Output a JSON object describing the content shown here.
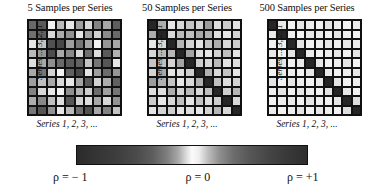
{
  "figure": {
    "caption_symbols": {
      "rho": "ρ"
    }
  },
  "panels": [
    {
      "id": "panel-5-samples",
      "title": "5 Samples per Series",
      "ylabel": "Series ... 3, 2, 1",
      "xlabel": "Series 1, 2, 3, ..."
    },
    {
      "id": "panel-50-samples",
      "title": "50 Samples per Series",
      "ylabel": "Series ... 3, 2, 1",
      "xlabel": "Series 1, 2, 3, ..."
    },
    {
      "id": "panel-500-samples",
      "title": "500 Samples per Series",
      "ylabel": "Series ... 3, 2, 1",
      "xlabel": "Series 1, 2, 3, ..."
    }
  ],
  "colorbar": {
    "label_min": "ρ = − 1",
    "label_mid": "ρ = 0",
    "label_max": "ρ = +1",
    "min_value": -1,
    "mid_value": 0,
    "max_value": 1,
    "colors": {
      "min": "#2b2b2b",
      "mid": "#fbfbfb",
      "max": "#2e2e2e"
    }
  },
  "chart_data": {
    "type": "heatmap",
    "n_panels": 3,
    "grid": {
      "rows": 10,
      "cols": 10
    },
    "xlabel": "Series 1, 2, 3, ...",
    "ylabel": "Series ... 3, 2, 1",
    "zlabel": "ρ",
    "zlim": [
      -1,
      1
    ],
    "colormap": "symmetric grayscale: dark at ρ=−1, white at ρ=0, dark at ρ=+1",
    "legend_position": "bottom horizontal colorbar",
    "grid_on": true,
    "panels": [
      {
        "title": "5 Samples per Series",
        "samples_per_series": 5,
        "note": "Noisy estimates: correlations scatter widely across the full −1..+1 range; diagonal not distinguishable.",
        "values": [
          [
            0.62,
            0.7,
            0.02,
            0.22,
            0.05,
            0.35,
            0.1,
            0.48,
            0.3,
            0.68
          ],
          [
            0.58,
            0.66,
            -0.1,
            0.28,
            0.4,
            0.05,
            0.32,
            0.12,
            0.44,
            0.62
          ],
          [
            0.05,
            0.18,
            0.75,
            0.8,
            0.35,
            0.55,
            0.3,
            0.02,
            0.38,
            0.3
          ],
          [
            0.22,
            0.38,
            0.78,
            0.3,
            0.45,
            0.1,
            0.58,
            0.08,
            0.7,
            0.26
          ],
          [
            0.08,
            0.3,
            0.42,
            0.62,
            0.7,
            0.65,
            0.18,
            0.55,
            0.72,
            0.05
          ],
          [
            0.3,
            0.55,
            0.12,
            0.02,
            0.66,
            0.8,
            0.06,
            0.35,
            0.6,
            0.38
          ],
          [
            0.35,
            0.2,
            0.3,
            0.1,
            0.05,
            0.32,
            0.7,
            0.12,
            0.28,
            0.66
          ],
          [
            0.48,
            0.1,
            0.05,
            0.02,
            0.42,
            0.25,
            0.14,
            0.6,
            0.34,
            0.55
          ],
          [
            0.28,
            0.45,
            0.2,
            0.08,
            0.72,
            0.12,
            0.08,
            0.3,
            0.1,
            0.4
          ],
          [
            0.55,
            0.72,
            0.4,
            0.05,
            0.22,
            0.58,
            0.75,
            0.3,
            0.48,
            0.18
          ]
        ]
      },
      {
        "title": "50 Samples per Series",
        "samples_per_series": 50,
        "note": "Diagonal (ρ=+1) clearly visible as dark cells; off-diagonal estimates cluster near ρ=0 (light) with moderate noise.",
        "values": [
          [
            1.0,
            0.28,
            0.05,
            0.1,
            0.18,
            0.12,
            0.36,
            0.08,
            0.15,
            0.06
          ],
          [
            0.28,
            1.0,
            0.1,
            0.22,
            0.2,
            0.3,
            0.26,
            0.08,
            0.05,
            0.12
          ],
          [
            0.05,
            0.1,
            1.0,
            0.24,
            0.12,
            0.06,
            0.18,
            0.28,
            0.1,
            0.14
          ],
          [
            0.1,
            0.22,
            0.24,
            1.0,
            0.32,
            0.08,
            0.05,
            0.12,
            0.2,
            0.06
          ],
          [
            0.18,
            0.2,
            0.12,
            0.32,
            1.0,
            0.14,
            0.1,
            0.22,
            0.06,
            0.08
          ],
          [
            0.12,
            0.3,
            0.06,
            0.08,
            0.14,
            1.0,
            0.26,
            0.1,
            0.18,
            0.05
          ],
          [
            0.36,
            0.26,
            0.18,
            0.05,
            0.1,
            0.26,
            1.0,
            0.2,
            0.08,
            0.12
          ],
          [
            0.08,
            0.08,
            0.28,
            0.12,
            0.22,
            0.1,
            0.2,
            1.0,
            0.14,
            0.24
          ],
          [
            0.15,
            0.05,
            0.1,
            0.2,
            0.06,
            0.18,
            0.08,
            0.14,
            1.0,
            0.1
          ],
          [
            0.06,
            0.12,
            0.14,
            0.06,
            0.08,
            0.05,
            0.12,
            0.24,
            0.1,
            1.0
          ]
        ]
      },
      {
        "title": "500 Samples per Series",
        "samples_per_series": 500,
        "note": "Off-diagonal estimates converge to ρ≈0 (nearly white); only the unit diagonal remains dark.",
        "values": [
          [
            1.0,
            0.04,
            0.02,
            0.05,
            0.03,
            0.02,
            0.06,
            0.03,
            0.02,
            0.04
          ],
          [
            0.04,
            1.0,
            0.03,
            0.02,
            0.05,
            0.04,
            0.02,
            0.06,
            0.03,
            0.02
          ],
          [
            0.02,
            0.03,
            1.0,
            0.06,
            0.02,
            0.03,
            0.05,
            0.02,
            0.04,
            0.03
          ],
          [
            0.05,
            0.02,
            0.06,
            1.0,
            0.04,
            0.02,
            0.03,
            0.05,
            0.02,
            0.06
          ],
          [
            0.03,
            0.05,
            0.02,
            0.04,
            1.0,
            0.05,
            0.02,
            0.03,
            0.06,
            0.02
          ],
          [
            0.02,
            0.04,
            0.03,
            0.02,
            0.05,
            1.0,
            0.04,
            0.02,
            0.03,
            0.05
          ],
          [
            0.06,
            0.02,
            0.05,
            0.03,
            0.02,
            0.04,
            1.0,
            0.06,
            0.02,
            0.03
          ],
          [
            0.03,
            0.06,
            0.02,
            0.05,
            0.03,
            0.02,
            0.06,
            1.0,
            0.05,
            0.02
          ],
          [
            0.02,
            0.03,
            0.04,
            0.02,
            0.06,
            0.03,
            0.02,
            0.05,
            1.0,
            0.08
          ],
          [
            0.04,
            0.02,
            0.03,
            0.06,
            0.02,
            0.05,
            0.03,
            0.02,
            0.08,
            1.0
          ]
        ]
      }
    ]
  }
}
